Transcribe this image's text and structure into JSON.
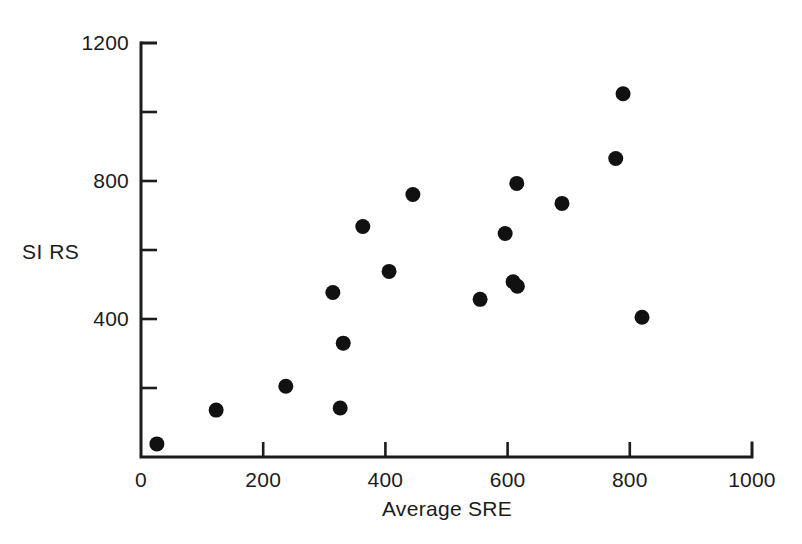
{
  "chart_data": {
    "type": "scatter",
    "title": "",
    "xlabel": "Average SRE",
    "ylabel": "SI RS",
    "xlim": [
      0,
      1000
    ],
    "ylim": [
      0,
      1200
    ],
    "xticks": [
      0,
      200,
      400,
      600,
      800,
      1000
    ],
    "yticks": [
      400,
      800,
      1200
    ],
    "yticks_minor": [
      200,
      600,
      1000
    ],
    "xtick_labels": [
      "0",
      "200",
      "400",
      "600",
      "800",
      "1000"
    ],
    "ytick_labels": [
      "400",
      "800",
      "1200"
    ],
    "grid": false,
    "legend": null,
    "marker": {
      "shape": "circle",
      "color": "#111111",
      "size_px": 15
    },
    "points": [
      {
        "x": 26,
        "y": 38
      },
      {
        "x": 123,
        "y": 136
      },
      {
        "x": 237,
        "y": 205
      },
      {
        "x": 314,
        "y": 477
      },
      {
        "x": 326,
        "y": 142
      },
      {
        "x": 331,
        "y": 330
      },
      {
        "x": 363,
        "y": 668
      },
      {
        "x": 406,
        "y": 538
      },
      {
        "x": 445,
        "y": 761
      },
      {
        "x": 555,
        "y": 457
      },
      {
        "x": 596,
        "y": 648
      },
      {
        "x": 609,
        "y": 508
      },
      {
        "x": 616,
        "y": 495
      },
      {
        "x": 615,
        "y": 793
      },
      {
        "x": 689,
        "y": 735
      },
      {
        "x": 777,
        "y": 865
      },
      {
        "x": 789,
        "y": 1053
      },
      {
        "x": 820,
        "y": 405
      }
    ]
  },
  "axes": {
    "y_axis_name": "SI RS",
    "x_axis_name": "Average SRE"
  }
}
